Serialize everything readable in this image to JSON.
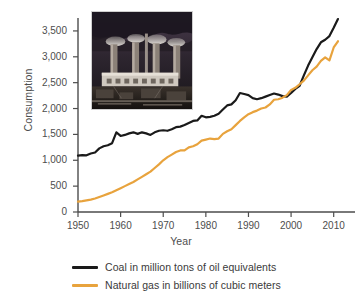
{
  "chart_data": {
    "type": "line",
    "title": "",
    "xlabel": "Year",
    "ylabel": "Consumption",
    "xlim": [
      1950,
      2015
    ],
    "ylim": [
      0,
      3750
    ],
    "grid": false,
    "legend_position": "bottom",
    "xticks": [
      "1950",
      "1960",
      "1970",
      "1980",
      "1990",
      "2000",
      "2010"
    ],
    "xtick_values": [
      1950,
      1960,
      1970,
      1980,
      1990,
      2000,
      2010
    ],
    "yticks": [
      "0",
      "500",
      "1,000",
      "1,500",
      "2,000",
      "2,500",
      "3,000",
      "3,500"
    ],
    "ytick_values": [
      0,
      500,
      1000,
      1500,
      2000,
      2500,
      3000,
      3500
    ],
    "x": [
      1950,
      1951,
      1952,
      1953,
      1954,
      1955,
      1956,
      1957,
      1958,
      1959,
      1960,
      1961,
      1962,
      1963,
      1964,
      1965,
      1966,
      1967,
      1968,
      1969,
      1970,
      1971,
      1972,
      1973,
      1974,
      1975,
      1976,
      1977,
      1978,
      1979,
      1980,
      1981,
      1982,
      1983,
      1984,
      1985,
      1986,
      1987,
      1988,
      1989,
      1990,
      1991,
      1992,
      1993,
      1994,
      1995,
      1996,
      1997,
      1998,
      1999,
      2000,
      2001,
      2002,
      2003,
      2004,
      2005,
      2006,
      2007,
      2008,
      2009,
      2010,
      2011
    ],
    "series": [
      {
        "name": "Coal in million tons of oil equivalents",
        "color": "#1a1a1a",
        "values": [
          1090,
          1100,
          1095,
          1130,
          1150,
          1230,
          1270,
          1290,
          1330,
          1540,
          1470,
          1490,
          1520,
          1540,
          1510,
          1540,
          1520,
          1490,
          1540,
          1570,
          1580,
          1570,
          1600,
          1640,
          1650,
          1680,
          1720,
          1760,
          1770,
          1860,
          1830,
          1840,
          1860,
          1900,
          1980,
          2060,
          2080,
          2160,
          2300,
          2280,
          2260,
          2200,
          2180,
          2200,
          2230,
          2260,
          2290,
          2270,
          2240,
          2230,
          2300,
          2380,
          2440,
          2640,
          2830,
          2990,
          3150,
          3280,
          3330,
          3400,
          3560,
          3730
        ]
      },
      {
        "name": "Natural gas in billions of cubic meters",
        "color": "#E8A33D",
        "values": [
          200,
          210,
          225,
          240,
          260,
          290,
          320,
          350,
          380,
          420,
          460,
          500,
          540,
          580,
          630,
          680,
          730,
          780,
          850,
          920,
          1000,
          1060,
          1110,
          1160,
          1190,
          1190,
          1250,
          1270,
          1310,
          1380,
          1400,
          1420,
          1410,
          1420,
          1510,
          1560,
          1600,
          1680,
          1760,
          1830,
          1890,
          1930,
          1960,
          2000,
          2020,
          2080,
          2170,
          2180,
          2210,
          2260,
          2360,
          2400,
          2470,
          2540,
          2640,
          2740,
          2810,
          2920,
          2990,
          2930,
          3180,
          3300
        ]
      }
    ]
  },
  "axes": {
    "y_title": "Consumption",
    "x_title": "Year"
  },
  "inset": {
    "name": "power-plant-photo",
    "description": "Coal power plant with smokestacks emitting smoke"
  },
  "legend": {
    "items": [
      {
        "label": "Coal in million tons of oil equivalents",
        "color": "#1a1a1a"
      },
      {
        "label": "Natural gas in billions of cubic meters",
        "color": "#E8A33D"
      }
    ]
  },
  "colors": {
    "coal": "#1a1a1a",
    "gas": "#E8A33D",
    "axis": "#4d4d4d",
    "text": "#4d4d4d",
    "background": "#ffffff"
  }
}
